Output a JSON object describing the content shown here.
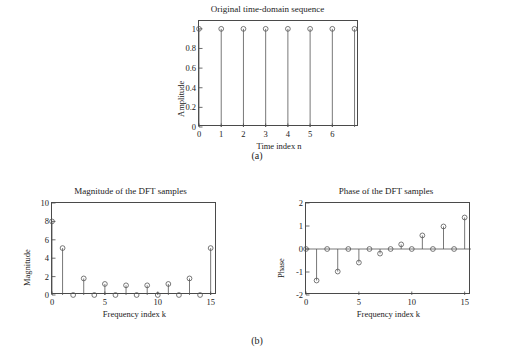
{
  "page": {
    "background": "#ffffff",
    "line_color": "#555555",
    "axis_color": "#4a4a4a"
  },
  "subfigures": [
    {
      "label": "(a)"
    },
    {
      "label": "(b)"
    }
  ],
  "chart_data": [
    {
      "type": "line",
      "plot_style": "stem",
      "title": "Original time-domain sequence",
      "xlabel": "Time index n",
      "ylabel": "Amplitude",
      "x": [
        0,
        1,
        2,
        3,
        4,
        5,
        6,
        7
      ],
      "values": [
        1,
        1,
        1,
        1,
        1,
        1,
        1,
        1
      ],
      "xlim": [
        0,
        7.2
      ],
      "ylim": [
        0,
        1.08
      ],
      "xticks": [
        0,
        1,
        2,
        3,
        4,
        5,
        6
      ],
      "xticklabels": [
        "0",
        "1",
        "2",
        "3",
        "4",
        "5",
        "6"
      ],
      "yticks": [
        0,
        0.2,
        0.4,
        0.6,
        0.8,
        1
      ],
      "yticklabels": [
        "0",
        "0.2",
        "0.4",
        "0.6",
        "0.8",
        "1"
      ],
      "grid": false,
      "legend": "none"
    },
    {
      "type": "line",
      "plot_style": "stem",
      "title": "Magnitude of the DFT samples",
      "xlabel": "Frequency index k",
      "ylabel": "Magnitude",
      "x": [
        0,
        1,
        2,
        3,
        4,
        5,
        6,
        7,
        8,
        9,
        10,
        11,
        12,
        13,
        14,
        15
      ],
      "values": [
        8,
        5.1,
        0,
        1.8,
        0,
        1.2,
        0,
        1.05,
        0,
        1.05,
        0,
        1.2,
        0,
        1.8,
        0,
        5.1
      ],
      "xlim": [
        0,
        15.6
      ],
      "ylim": [
        0,
        10
      ],
      "xticks": [
        0,
        5,
        10,
        15
      ],
      "xticklabels": [
        "0",
        "5",
        "10",
        "15"
      ],
      "yticks": [
        0,
        2,
        4,
        6,
        8,
        10
      ],
      "yticklabels": [
        "0",
        "2",
        "4",
        "6",
        "8",
        "10"
      ],
      "grid": false,
      "legend": "none"
    },
    {
      "type": "line",
      "plot_style": "stem",
      "title": "Phase of the DFT samples",
      "xlabel": "Frequency index k",
      "ylabel": "Phase",
      "x": [
        0,
        1,
        2,
        3,
        4,
        5,
        6,
        7,
        8,
        9,
        10,
        11,
        12,
        13,
        14,
        15
      ],
      "values": [
        0,
        -1.37,
        0,
        -0.98,
        0,
        -0.59,
        0,
        -0.2,
        0,
        0.2,
        0,
        0.59,
        0,
        0.98,
        0,
        1.37
      ],
      "xlim": [
        0,
        15.6
      ],
      "ylim": [
        -2,
        2
      ],
      "xticks": [
        0,
        5,
        10,
        15
      ],
      "xticklabels": [
        "0",
        "5",
        "10",
        "15"
      ],
      "yticks": [
        -2,
        -1,
        0,
        1,
        2
      ],
      "yticklabels": [
        "-2",
        "-1",
        "0",
        "1",
        "2"
      ],
      "grid": false,
      "legend": "none"
    }
  ]
}
